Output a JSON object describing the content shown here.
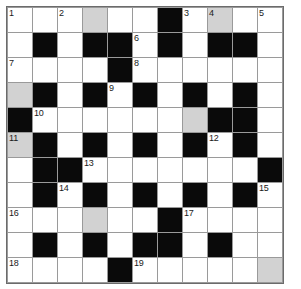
{
  "puzzle": {
    "type": "crossword-grid",
    "rows": 11,
    "columns": 11,
    "cell_size_px": 25,
    "colors": {
      "block": "#0a0a0a",
      "open": "#ffffff",
      "highlight": "#d2d2d2",
      "grid_line": "#9a9a9a",
      "border": "#6b6b6b",
      "number_text": "#1a1a1a"
    },
    "legend": {
      "W": "open white cell",
      "G": "shaded highlighted cell",
      "B": "blocked black cell"
    },
    "cells": [
      [
        "W",
        "W",
        "W",
        "G",
        "W",
        "W",
        "B",
        "W",
        "G",
        "W",
        "W"
      ],
      [
        "W",
        "B",
        "W",
        "B",
        "B",
        "W",
        "B",
        "W",
        "B",
        "B",
        "W"
      ],
      [
        "W",
        "W",
        "W",
        "W",
        "B",
        "W",
        "W",
        "W",
        "W",
        "W",
        "W"
      ],
      [
        "G",
        "B",
        "W",
        "B",
        "W",
        "B",
        "W",
        "B",
        "W",
        "B",
        "W"
      ],
      [
        "B",
        "W",
        "W",
        "W",
        "W",
        "W",
        "W",
        "G",
        "B",
        "B",
        "W"
      ],
      [
        "G",
        "B",
        "W",
        "B",
        "W",
        "B",
        "W",
        "B",
        "W",
        "B",
        "W"
      ],
      [
        "W",
        "B",
        "B",
        "W",
        "W",
        "W",
        "W",
        "W",
        "W",
        "W",
        "B"
      ],
      [
        "W",
        "B",
        "W",
        "B",
        "W",
        "B",
        "W",
        "B",
        "W",
        "B",
        "W"
      ],
      [
        "W",
        "W",
        "W",
        "G",
        "W",
        "W",
        "B",
        "W",
        "W",
        "W",
        "W"
      ],
      [
        "W",
        "B",
        "W",
        "B",
        "W",
        "B",
        "B",
        "W",
        "B",
        "W",
        "W"
      ],
      [
        "W",
        "W",
        "W",
        "W",
        "B",
        "W",
        "W",
        "W",
        "W",
        "W",
        "G"
      ]
    ],
    "numbers": [
      [
        "1",
        "",
        "2",
        "",
        "",
        "",
        "",
        "3",
        "4",
        "",
        "5"
      ],
      [
        "",
        "",
        "",
        "",
        "",
        "6",
        "",
        "",
        "",
        "",
        ""
      ],
      [
        "7",
        "",
        "",
        "",
        "",
        "8",
        "",
        "",
        "",
        "",
        ""
      ],
      [
        "",
        "",
        "",
        "",
        "9",
        "",
        "",
        "",
        "",
        "",
        ""
      ],
      [
        "",
        "10",
        "",
        "",
        "",
        "",
        "",
        "",
        "",
        "",
        ""
      ],
      [
        "11",
        "",
        "",
        "",
        "",
        "",
        "",
        "",
        "12",
        "",
        ""
      ],
      [
        "",
        "",
        "",
        "13",
        "",
        "",
        "",
        "",
        "",
        "",
        ""
      ],
      [
        "",
        "",
        "14",
        "",
        "",
        "",
        "",
        "",
        "",
        "",
        "15"
      ],
      [
        "16",
        "",
        "",
        "",
        "",
        "",
        "",
        "17",
        "",
        "",
        ""
      ],
      [
        "",
        "",
        "",
        "",
        "",
        "",
        "",
        "",
        "",
        "",
        ""
      ],
      [
        "18",
        "",
        "",
        "",
        "",
        "19",
        "",
        "",
        "",
        "",
        ""
      ]
    ],
    "entries": [
      [
        "",
        "",
        "",
        "",
        "",
        "",
        "",
        "",
        "",
        "",
        ""
      ],
      [
        "",
        "",
        "",
        "",
        "",
        "",
        "",
        "",
        "",
        "",
        ""
      ],
      [
        "",
        "",
        "",
        "",
        "",
        "",
        "",
        "",
        "",
        "",
        ""
      ],
      [
        "",
        "",
        "",
        "",
        "",
        "",
        "",
        "",
        "",
        "",
        ""
      ],
      [
        "",
        "",
        "",
        "",
        "",
        "",
        "",
        "",
        "",
        "",
        ""
      ],
      [
        "",
        "",
        "",
        "",
        "",
        "",
        "",
        "",
        "",
        "",
        ""
      ],
      [
        "",
        "",
        "",
        "",
        "",
        "",
        "",
        "",
        "",
        "",
        ""
      ],
      [
        "",
        "",
        "",
        "",
        "",
        "",
        "",
        "",
        "",
        "",
        ""
      ],
      [
        "",
        "",
        "",
        "",
        "",
        "",
        "",
        "",
        "",
        "",
        ""
      ],
      [
        "",
        "",
        "",
        "",
        "",
        "",
        "",
        "",
        "",
        "",
        ""
      ],
      [
        "",
        "",
        "",
        "",
        "",
        "",
        "",
        "",
        "",
        "",
        ""
      ]
    ],
    "clue_numbers_list": [
      "1",
      "2",
      "3",
      "4",
      "5",
      "6",
      "7",
      "8",
      "9",
      "10",
      "11",
      "12",
      "13",
      "14",
      "15",
      "16",
      "17",
      "18",
      "19"
    ]
  }
}
